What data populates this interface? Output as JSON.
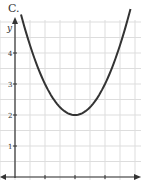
{
  "label": "C.",
  "chart_data": {
    "type": "line",
    "title": "C.",
    "xlabel": "",
    "ylabel": "y",
    "equation": "y = (x - 2)^2 + 2",
    "vertex": [
      2,
      2
    ],
    "x": [
      0.3,
      0.5,
      1,
      1.5,
      2,
      2.5,
      3,
      3.5,
      3.75
    ],
    "values": [
      4.89,
      4.25,
      3,
      2.25,
      2,
      2.25,
      3,
      4.25,
      5.06
    ],
    "yticks": [
      "1",
      "2",
      "3",
      "4"
    ],
    "xlim": [
      -0.5,
      4.3
    ],
    "ylim": [
      0,
      5.1
    ],
    "grid": true
  }
}
